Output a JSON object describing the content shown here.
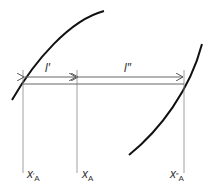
{
  "diagram": {
    "labels": {
      "l_prime": "l′",
      "l_double_prime": "l″",
      "x_a_prime_main": "x",
      "x_a_prime_sup": "′",
      "x_a_prime_sub": "A",
      "x_a_main": "x",
      "x_a_sub": "A",
      "x_a_double_prime_main": "x",
      "x_a_double_prime_sup": "″",
      "x_a_double_prime_sub": "A"
    },
    "colors": {
      "curve": "#111111",
      "line": "#777777",
      "text": "#333333"
    }
  }
}
